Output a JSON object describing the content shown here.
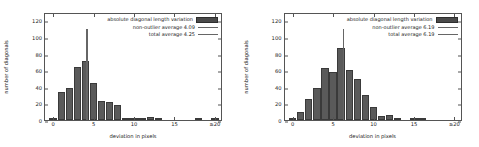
{
  "figure": {
    "panel_count": 2,
    "axis": {
      "ylabel": "number of diagonals",
      "xlabel": "deviation in pixels",
      "yticks": [
        "0",
        "20",
        "40",
        "60",
        "80",
        "100",
        "120"
      ],
      "xticks": [
        "0",
        "5",
        "10",
        "15",
        "≥20"
      ]
    },
    "colors": {
      "bar_fill": "#5a5a5a",
      "bar_edge": "#3a3a3a",
      "line": "#666666",
      "frame": "#555555",
      "text": "#222222",
      "background": "#ffffff"
    }
  },
  "chart_data": [
    {
      "type": "bar",
      "title": "",
      "xlabel": "deviation in pixels",
      "ylabel": "number of diagonals",
      "xlim": [
        -1,
        21
      ],
      "ylim": [
        0,
        130
      ],
      "yticks": [
        0,
        20,
        40,
        60,
        80,
        100,
        120
      ],
      "xticks": [
        0,
        5,
        10,
        15,
        20
      ],
      "xticklabels": [
        "0",
        "5",
        "10",
        "15",
        "≥20"
      ],
      "grid": false,
      "legend_position": "upper right",
      "legend": [
        "absolute diagonal length variation",
        "non-outlier average 4.09",
        "total average 4.25"
      ],
      "series": [
        {
          "name": "absolute diagonal length variation",
          "bin_centers": [
            0,
            1,
            2,
            3,
            4,
            5,
            6,
            7,
            8,
            9,
            10,
            11,
            12,
            13,
            14,
            15,
            16,
            17,
            18,
            19,
            20
          ],
          "values": [
            2,
            34,
            38,
            64,
            71,
            44,
            23,
            22,
            18,
            3,
            1,
            2,
            4,
            1,
            0,
            0,
            0,
            0,
            1,
            0,
            2
          ]
        }
      ],
      "markers": [
        {
          "name": "non-outlier average",
          "value": 4.09,
          "height": 110
        },
        {
          "name": "total average",
          "value": 4.25,
          "height": 110
        }
      ]
    },
    {
      "type": "bar",
      "title": "",
      "xlabel": "deviation in pixels",
      "ylabel": "number of diagonals",
      "xlim": [
        -1,
        21
      ],
      "ylim": [
        0,
        130
      ],
      "yticks": [
        0,
        20,
        40,
        60,
        80,
        100,
        120
      ],
      "xticks": [
        0,
        5,
        10,
        15,
        20
      ],
      "xticklabels": [
        "0",
        "5",
        "10",
        "15",
        "≥20"
      ],
      "grid": false,
      "legend_position": "upper right",
      "legend": [
        "absolute diagonal length variation",
        "non-outlier average 6.19",
        "total average 6.19"
      ],
      "series": [
        {
          "name": "absolute diagonal length variation",
          "bin_centers": [
            0,
            1,
            2,
            3,
            4,
            5,
            6,
            7,
            8,
            9,
            10,
            11,
            12,
            13,
            14,
            15,
            16,
            17,
            18,
            19,
            20
          ],
          "values": [
            3,
            10,
            25,
            38,
            63,
            58,
            87,
            60,
            49,
            30,
            16,
            5,
            6,
            2,
            0,
            3,
            3,
            0,
            0,
            0,
            0
          ]
        }
      ],
      "markers": [
        {
          "name": "non-outlier average",
          "value": 6.19,
          "height": 110
        },
        {
          "name": "total average",
          "value": 6.19,
          "height": 110
        }
      ]
    }
  ],
  "panels": [
    {
      "legend": {
        "bars_label": "absolute diagonal length variation",
        "nonoutlier_label": "non-outlier average 4.09",
        "total_label": "total average 4.25"
      }
    },
    {
      "legend": {
        "bars_label": "absolute diagonal length variation",
        "nonoutlier_label": "non-outlier average 6.19",
        "total_label": "total average 6.19"
      }
    }
  ]
}
